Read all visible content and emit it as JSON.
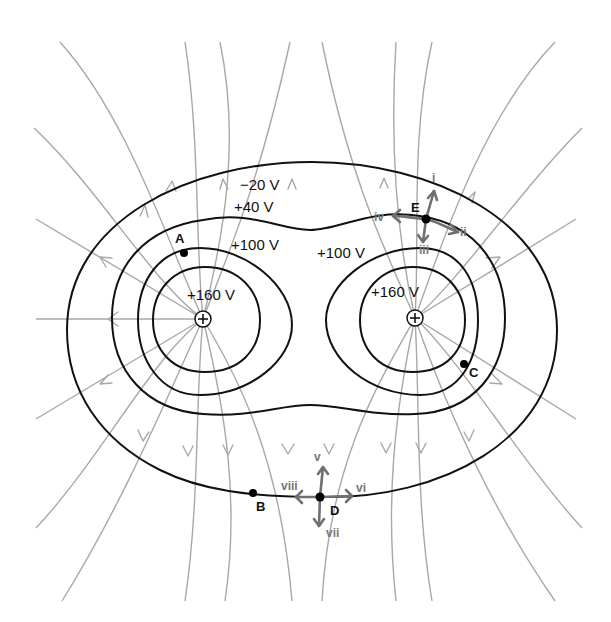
{
  "diagram": {
    "type": "electric-field-equipotential-map",
    "charges": [
      {
        "id": "left",
        "sign": "+",
        "x": 203,
        "y": 319
      },
      {
        "id": "right",
        "sign": "+",
        "x": 415,
        "y": 318
      }
    ],
    "equipotentials": [
      {
        "label": "−20 V"
      },
      {
        "label": "+40 V"
      },
      {
        "label": "+100 V",
        "side": "left"
      },
      {
        "label": "+100 V",
        "side": "right"
      },
      {
        "label": "+160 V",
        "side": "left"
      },
      {
        "label": "+160 V",
        "side": "right"
      }
    ],
    "points": [
      {
        "label": "A"
      },
      {
        "label": "B"
      },
      {
        "label": "C"
      },
      {
        "label": "D"
      },
      {
        "label": "E"
      }
    ],
    "vectors_at_E": [
      "i",
      "ii",
      "iii",
      "iv"
    ],
    "vectors_at_D": [
      "v",
      "vi",
      "vii",
      "viii"
    ],
    "colors": {
      "equipotential": "#111111",
      "field_line": "#a8a8a8",
      "vector": "#707070"
    }
  }
}
